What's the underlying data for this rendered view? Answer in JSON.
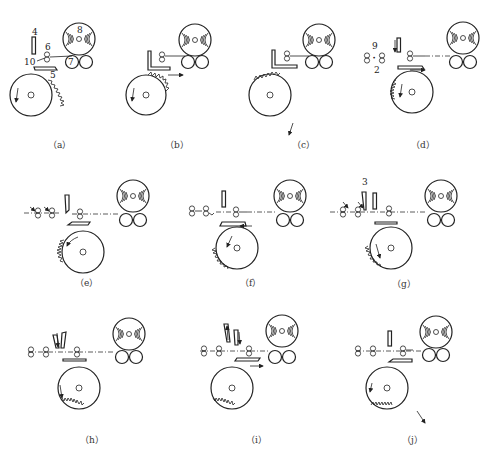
{
  "figure": {
    "part_labels": {
      "a": [
        "4",
        "6",
        "10",
        "8",
        "7",
        "5"
      ],
      "d": [
        "9",
        "2"
      ],
      "g": [
        "3"
      ]
    },
    "panels": [
      {
        "id": "a",
        "caption": "（a）",
        "x": 0,
        "y": 0
      },
      {
        "id": "b",
        "caption": "（b）",
        "x": 120,
        "y": 0
      },
      {
        "id": "c",
        "caption": "（c）",
        "x": 240,
        "y": 0
      },
      {
        "id": "d",
        "caption": "（d）",
        "x": 360,
        "y": 0
      },
      {
        "id": "e",
        "caption": "（e）",
        "x": 0,
        "y": 160
      },
      {
        "id": "f",
        "caption": "（f）",
        "x": 170,
        "y": 160
      },
      {
        "id": "g",
        "caption": "（g）",
        "x": 330,
        "y": 160
      },
      {
        "id": "h",
        "caption": "（h）",
        "x": 0,
        "y": 310
      },
      {
        "id": "i",
        "caption": "（i）",
        "x": 170,
        "y": 310
      },
      {
        "id": "j",
        "caption": "（j）",
        "x": 330,
        "y": 310
      }
    ]
  },
  "labels": {
    "a4": "4",
    "a6": "6",
    "a10": "10",
    "a8": "8",
    "a7": "7",
    "a5": "5",
    "d9": "9",
    "d2": "2",
    "g3": "3"
  },
  "captions": {
    "a": "（a）",
    "b": "（b）",
    "c": "（c）",
    "d": "（d）",
    "e": "（e）",
    "f": "（f）",
    "g": "（g）",
    "h": "（h）",
    "i": "（i）",
    "j": "（j）"
  },
  "colors": {
    "ink": "#222222",
    "background": "#ffffff"
  }
}
